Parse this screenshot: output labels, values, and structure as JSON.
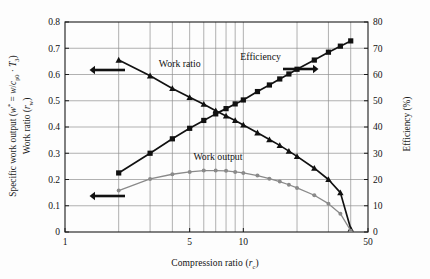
{
  "figure": {
    "background_color": "#fdfdfd",
    "plot_border_color": "#1a1a1a",
    "grid_color": "#8f8f8f"
  },
  "axes": {
    "x_title_plain": "Compression ratio (rc)",
    "x_title_main": "Compression ratio (",
    "x_title_ital": "r",
    "x_title_sub": "c",
    "x_title_end": ")",
    "y_left_line1_a": "Specific work output (",
    "y_left_line1_ital1": "w",
    "y_left_line1_sup": "*",
    "y_left_line1_eq": " = ",
    "y_left_line1_ital2": "w",
    "y_left_line1_slash": "/",
    "y_left_line1_ital3": "c",
    "y_left_line1_sub1": "p0",
    "y_left_line1_dot": " · ",
    "y_left_line1_ital4": "T",
    "y_left_line1_sub2": "3",
    "y_left_line1_end": ")",
    "y_left_line2_a": "Work ratio (",
    "y_left_line2_ital": "r",
    "y_left_line2_sub": "w",
    "y_left_line2_end": ")",
    "y_right_title": "Efficiency (%)"
  },
  "annotations": {
    "work_ratio_label": "Work ratio",
    "efficiency_label": "Efficiency",
    "work_output_label": "Work output",
    "arrow_left_upper": "arrow-left",
    "arrow_left_lower": "arrow-left",
    "arrow_right": "arrow-right"
  },
  "chart_data": {
    "type": "line",
    "title": "",
    "xlabel": "Compression ratio (r_c)",
    "ylabel": "Specific work output (w* = w/c_p0 · T_3) / Work ratio (r_w)",
    "y2label": "Efficiency (%)",
    "xscale": "log",
    "xlim": [
      1,
      50
    ],
    "ylim": [
      0,
      0.8
    ],
    "y2lim": [
      0,
      80
    ],
    "grid": true,
    "legend_position": "inline-annotations",
    "x_ticks": [
      1,
      5,
      10,
      50
    ],
    "x_tick_labels": [
      "1",
      "5",
      "10",
      "50"
    ],
    "x_gridlines": [
      2,
      3,
      4,
      5,
      6,
      7,
      8,
      9,
      10,
      20,
      30,
      40
    ],
    "y_ticks": [
      0,
      0.1,
      0.2,
      0.3,
      0.4,
      0.5,
      0.6,
      0.7,
      0.8
    ],
    "y_tick_labels": [
      "0",
      "0.1",
      "0.2",
      "0.3",
      "0.4",
      "0.5",
      "0.6",
      "0.7",
      "0.8"
    ],
    "y2_ticks": [
      0,
      10,
      20,
      30,
      40,
      50,
      60,
      70,
      80
    ],
    "y2_tick_labels": [
      "0",
      "10",
      "20",
      "30",
      "40",
      "50",
      "60",
      "70",
      "80"
    ],
    "series": [
      {
        "name": "Work ratio",
        "axis": "left",
        "marker": "triangle",
        "color": "#111111",
        "x": [
          2,
          3,
          4,
          5,
          6,
          7,
          8,
          9,
          10,
          12,
          14,
          16,
          18,
          20,
          25,
          30,
          35,
          40
        ],
        "values": [
          0.655,
          0.595,
          0.547,
          0.513,
          0.487,
          0.462,
          0.442,
          0.425,
          0.408,
          0.378,
          0.352,
          0.33,
          0.308,
          0.288,
          0.243,
          0.2,
          0.15,
          0.012
        ]
      },
      {
        "name": "Efficiency",
        "axis": "right",
        "marker": "square",
        "color": "#111111",
        "x": [
          2,
          3,
          4,
          5,
          6,
          7,
          8,
          9,
          10,
          12,
          14,
          16,
          18,
          20,
          25,
          30,
          35,
          40
        ],
        "values": [
          22.5,
          30.0,
          35.5,
          39.5,
          42.5,
          45.0,
          47.0,
          48.8,
          50.3,
          53.5,
          56.0,
          58.3,
          60.2,
          62.0,
          65.5,
          68.5,
          70.8,
          72.8
        ]
      },
      {
        "name": "Work output",
        "axis": "left",
        "marker": "circle",
        "color": "#8a8a8a",
        "x": [
          2,
          3,
          4,
          5,
          6,
          7,
          8,
          9,
          10,
          12,
          14,
          16,
          18,
          20,
          25,
          30,
          35,
          40
        ],
        "values": [
          0.158,
          0.202,
          0.22,
          0.229,
          0.234,
          0.234,
          0.233,
          0.229,
          0.225,
          0.215,
          0.203,
          0.192,
          0.18,
          0.168,
          0.14,
          0.108,
          0.07,
          0.005
        ]
      }
    ],
    "annotations": [
      {
        "text": "Work ratio",
        "x": 4.4,
        "y": 0.63,
        "points_to": "left-axis"
      },
      {
        "text": "Efficiency",
        "x": 12.5,
        "y": 0.655,
        "points_to": "right-axis"
      },
      {
        "text": "Work output",
        "x": 7.2,
        "y": 0.275,
        "points_to": "left-axis"
      }
    ]
  }
}
